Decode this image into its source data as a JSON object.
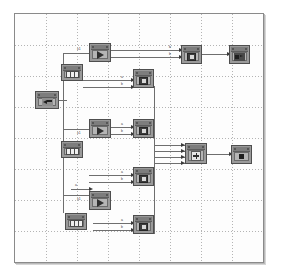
{
  "window": {
    "title": "Block Diagram Canvas",
    "background_color": "#ffffff"
  },
  "canvas": {
    "name": "block-diagram-canvas",
    "grid": {
      "visible": true,
      "spacing_px": 31,
      "style": "dotted",
      "color": "#b4b4b4"
    },
    "border_color": "#8a8a8a",
    "fill_color": "#fdfdfd",
    "width_px": 250,
    "height_px": 250
  },
  "blocks": [
    {
      "id": "src-left",
      "name": "source-block-left",
      "kind": "in-port",
      "x": 34,
      "y": 90,
      "w": 24,
      "h": 18,
      "label": "In1"
    },
    {
      "id": "num-1",
      "name": "numeric-block-1",
      "kind": "cells",
      "x": 60,
      "y": 63,
      "w": 22,
      "h": 17,
      "label": "Num1"
    },
    {
      "id": "num-2",
      "name": "numeric-block-2",
      "kind": "cells",
      "x": 60,
      "y": 140,
      "w": 22,
      "h": 17,
      "label": "Num2"
    },
    {
      "id": "num-3",
      "name": "numeric-block-3",
      "kind": "cells",
      "x": 64,
      "y": 212,
      "w": 22,
      "h": 17,
      "label": "Num3"
    },
    {
      "id": "gain-1",
      "name": "gain-block-1",
      "kind": "triangle",
      "x": 88,
      "y": 42,
      "w": 22,
      "h": 19,
      "label": "Gain1"
    },
    {
      "id": "gain-2",
      "name": "gain-block-2",
      "kind": "triangle",
      "x": 88,
      "y": 118,
      "w": 22,
      "h": 19,
      "label": "Gain2"
    },
    {
      "id": "gain-3",
      "name": "gain-block-3",
      "kind": "triangle",
      "x": 88,
      "y": 190,
      "w": 22,
      "h": 19,
      "label": "Gain3"
    },
    {
      "id": "scope-1",
      "name": "scope-block-1",
      "kind": "scope",
      "x": 132,
      "y": 68,
      "w": 21,
      "h": 19,
      "label": "S1"
    },
    {
      "id": "scope-2",
      "name": "scope-block-2",
      "kind": "scope",
      "x": 132,
      "y": 118,
      "w": 21,
      "h": 19,
      "label": "S2"
    },
    {
      "id": "scope-3",
      "name": "scope-block-3",
      "kind": "scope",
      "x": 132,
      "y": 166,
      "w": 21,
      "h": 19,
      "label": "S3"
    },
    {
      "id": "scope-4",
      "name": "scope-block-4",
      "kind": "scope",
      "x": 132,
      "y": 214,
      "w": 21,
      "h": 19,
      "label": "S4"
    },
    {
      "id": "scope-top",
      "name": "scope-block-top",
      "kind": "scope",
      "x": 180,
      "y": 44,
      "w": 21,
      "h": 19,
      "label": "S0"
    },
    {
      "id": "out-top",
      "name": "output-block-top",
      "kind": "out-arrow",
      "x": 228,
      "y": 44,
      "w": 21,
      "h": 19,
      "label": "Out1"
    },
    {
      "id": "sum",
      "name": "sum-block",
      "kind": "sum",
      "x": 184,
      "y": 142,
      "w": 22,
      "h": 21,
      "label": "Sum"
    },
    {
      "id": "out-right",
      "name": "output-block-right",
      "kind": "square",
      "x": 230,
      "y": 144,
      "w": 21,
      "h": 19,
      "label": "Out2"
    }
  ],
  "connections": [
    {
      "name": "wire-src-to-gain1",
      "from": "src-left",
      "to": "gain-1",
      "label": "x1"
    },
    {
      "name": "wire-src-to-gain2",
      "from": "src-left",
      "to": "gain-2",
      "label": "x1"
    },
    {
      "name": "wire-src-to-gain3",
      "from": "src-left",
      "to": "gain-3",
      "label": "x1"
    },
    {
      "name": "wire-gain1-to-scope-top",
      "from": "gain-1",
      "to": "scope-top",
      "label": "b"
    },
    {
      "name": "wire-gain1-to-scope-top-2",
      "from": "gain-1",
      "to": "scope-top",
      "label": "b"
    },
    {
      "name": "wire-num1-to-scope1",
      "from": "num-1",
      "to": "scope-1",
      "label": "a"
    },
    {
      "name": "wire-num1-to-scope1-2",
      "from": "num-1",
      "to": "scope-1",
      "label": "b"
    },
    {
      "name": "wire-gain2-to-scope2",
      "from": "gain-2",
      "to": "scope-2",
      "label": "a"
    },
    {
      "name": "wire-gain2-to-scope2-2",
      "from": "gain-2",
      "to": "scope-2",
      "label": "b"
    },
    {
      "name": "wire-num2-to-scope3",
      "from": "num-2",
      "to": "scope-3",
      "label": "a"
    },
    {
      "name": "wire-num2-to-scope3-2",
      "from": "num-2",
      "to": "scope-3",
      "label": "b"
    },
    {
      "name": "wire-num3-to-scope4",
      "from": "num-3",
      "to": "scope-4",
      "label": "a"
    },
    {
      "name": "wire-num3-to-scope4-2",
      "from": "num-3",
      "to": "scope-4",
      "label": "b"
    },
    {
      "name": "wire-scopes-to-sum",
      "from": "scope-1",
      "to": "sum",
      "label": ""
    },
    {
      "name": "wire-sum-to-out",
      "from": "sum",
      "to": "out-right",
      "label": ""
    },
    {
      "name": "wire-scopetop-to-out",
      "from": "scope-top",
      "to": "out-top",
      "label": ""
    }
  ],
  "port_labels": {
    "gain1_in": "x1",
    "gain2_in": "x1",
    "gain3_in": "x1",
    "gain3_in2": "a",
    "top_a": "b",
    "top_b": "b",
    "s1_a": "a",
    "s1_b": "b",
    "s2_a": "a",
    "s2_b": "b",
    "s3_a": "a",
    "s3_b": "b",
    "s4_a": "a",
    "s4_b": "b"
  },
  "colors": {
    "block_fill": "#9a9a9a",
    "block_body": "#b5b5b5",
    "block_stroke": "#4e4e4e",
    "wire": "#6e6e6e",
    "grid": "#b4b4b4",
    "canvas_bg": "#fdfdfd"
  }
}
